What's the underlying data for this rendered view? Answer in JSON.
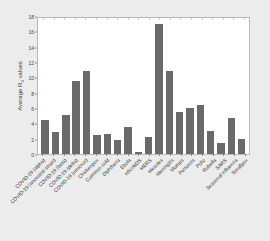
{
  "chart_data": {
    "type": "bar",
    "title": "",
    "xlabel": "",
    "ylabel": "Average R0 values",
    "ylabel_base": "Average R",
    "ylabel_sub": "0",
    "ylabel_suffix": " values",
    "ylim": [
      0,
      18
    ],
    "yticks": [
      0,
      2,
      4,
      6,
      8,
      10,
      12,
      14,
      16,
      18
    ],
    "ytick_labels": [
      "0",
      "2",
      "4",
      "6",
      "8",
      "10",
      "12",
      "14",
      "16",
      "18"
    ],
    "grid": false,
    "legend": null,
    "bar_color": "#6a6a6a",
    "categories": [
      "COVID-19 (alpha)",
      "COVID-19 (ancestral strain)",
      "COVID-19 (beta)",
      "COVID-19 (delta)",
      "COVID-19 (omicron)",
      "Chickenpox",
      "Common cold",
      "Diphtheria",
      "Ebola",
      "HIV/AIDS",
      "MERS",
      "Measles",
      "Meningitis",
      "Mumps",
      "Pertussis",
      "Polio",
      "Rubella",
      "SARS",
      "Seasonal influenza",
      "Smallpox"
    ],
    "values": [
      4.5,
      2.9,
      5.1,
      9.6,
      11.0,
      2.5,
      2.6,
      1.9,
      3.6,
      0.3,
      2.2,
      17.2,
      11.0,
      5.5,
      6.1,
      6.5,
      3.0,
      1.5,
      4.8,
      2.0
    ]
  }
}
